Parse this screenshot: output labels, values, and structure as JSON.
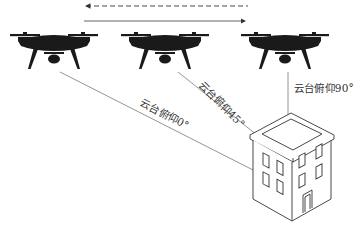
{
  "diagram": {
    "title": "",
    "drones": [
      {
        "id": "drone-left",
        "icon": "drone-icon",
        "x": 55,
        "y": 45
      },
      {
        "id": "drone-middle",
        "icon": "drone-icon",
        "x": 163,
        "y": 45
      },
      {
        "id": "drone-right",
        "icon": "drone-icon",
        "x": 285,
        "y": 45
      }
    ],
    "flight_arrows": {
      "dashed_arrow": {
        "direction": "left",
        "style": "dashed"
      },
      "solid_arrow": {
        "direction": "right",
        "style": "solid"
      }
    },
    "sight_lines": [
      {
        "label": "云台俯仰0°",
        "from": "drone-left",
        "to": "building"
      },
      {
        "label": "云台俯仰45°",
        "from": "drone-middle",
        "to": "building"
      },
      {
        "label": "云台俯仰90°",
        "from": "drone-right",
        "to": "building"
      }
    ],
    "target": {
      "icon": "building-icon",
      "label": ""
    },
    "colors": {
      "line": "#888888",
      "drone": "#1a1a1a",
      "building_stroke": "#333333",
      "arrow": "#444444"
    }
  }
}
